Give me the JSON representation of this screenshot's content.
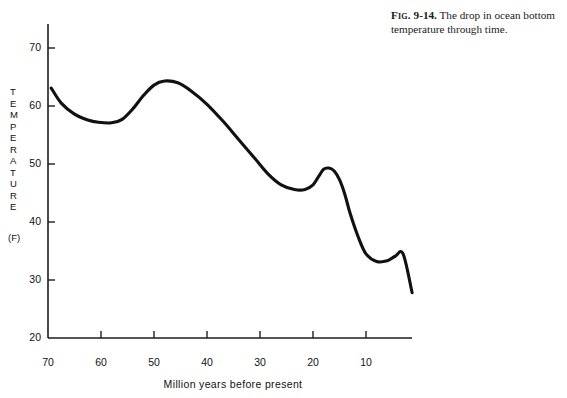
{
  "caption": {
    "fig_word": "Fig.",
    "fig_number": "9-14.",
    "text": "The drop in ocean bottom temperature through time."
  },
  "chart_data": {
    "type": "line",
    "title": "",
    "xlabel": "Million years before present",
    "ylabel": "TEMPERATURE",
    "yunit": "(F)",
    "xlim": [
      70,
      0
    ],
    "ylim": [
      20,
      75
    ],
    "x_ticks": [
      70,
      60,
      50,
      40,
      30,
      20,
      10
    ],
    "x_tick_labels": [
      "70",
      "60",
      "50",
      "40",
      "30",
      "20",
      "10"
    ],
    "y_ticks": [
      20,
      30,
      40,
      50,
      60,
      70
    ],
    "y_tick_labels": [
      "20",
      "30",
      "40",
      "50",
      "60",
      "70"
    ],
    "grid": false,
    "legend": "none",
    "line_color": "#111111",
    "series": [
      {
        "name": "Ocean bottom temperature",
        "x": [
          69.4,
          67.5,
          65.0,
          62.5,
          60.5,
          58.0,
          56.0,
          54.0,
          52.0,
          50.0,
          48.0,
          45.5,
          43.0,
          40.0,
          37.0,
          34.0,
          31.0,
          28.5,
          26.0,
          23.5,
          21.5,
          20.0,
          18.9,
          18.0,
          17.0,
          16.0,
          15.0,
          14.0,
          13.0,
          11.5,
          10.0,
          8.0,
          6.0,
          4.5,
          3.0,
          1.3
        ],
        "y": [
          63.1,
          60.5,
          58.6,
          57.6,
          57.2,
          57.1,
          57.7,
          59.5,
          61.8,
          63.6,
          64.3,
          64.0,
          62.6,
          60.3,
          57.4,
          54.2,
          51.0,
          48.3,
          46.4,
          45.6,
          45.6,
          46.4,
          47.9,
          49.1,
          49.3,
          48.8,
          47.3,
          44.8,
          41.5,
          37.5,
          34.5,
          33.2,
          33.3,
          34.1,
          34.5,
          27.8
        ]
      }
    ]
  },
  "axis_geometry": {
    "origin_x_px": 48,
    "origin_y_px": 338,
    "x_right_px": 412,
    "y_top_px": 24,
    "px_per_myr": 5.3,
    "px_per_degree": 5.8
  }
}
